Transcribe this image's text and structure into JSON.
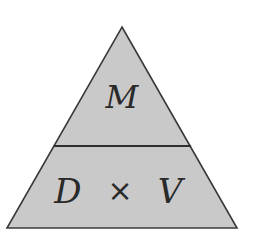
{
  "diagram": {
    "type": "formula-triangle",
    "colors": {
      "fill": "#c9c9c9",
      "stroke": "#3a3a3a",
      "text": "#2a2a2a",
      "background": "#ffffff"
    },
    "top_section": {
      "label": "M"
    },
    "bottom_section": {
      "left_label": "D",
      "operator": "×",
      "right_label": "V"
    }
  }
}
